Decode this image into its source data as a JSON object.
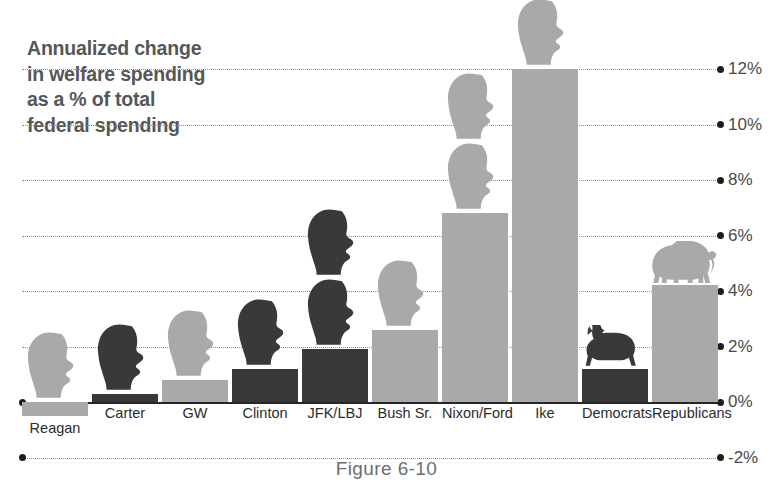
{
  "chart_data": {
    "type": "bar",
    "title": "Annualized change in welfare spending as a % of total federal spending",
    "title_lines": [
      "Annualized change",
      "in welfare spending",
      "as a % of total",
      "federal spending"
    ],
    "xlabel": "",
    "ylabel": "",
    "ylim": [
      -2,
      12.8
    ],
    "yticks": [
      12,
      10,
      8,
      6,
      4,
      2,
      0,
      -2
    ],
    "ytick_labels": [
      "12%",
      "10%",
      "8%",
      "6%",
      "4%",
      "2%",
      "0%",
      "-2%"
    ],
    "grid": true,
    "legend": "none",
    "categories": [
      "Reagan",
      "Carter",
      "GW",
      "Clinton",
      "JFK/LBJ",
      "Bush Sr.",
      "Nixon/Ford",
      "Ike",
      "Democrats",
      "Republicans"
    ],
    "values": [
      -0.5,
      0.3,
      0.8,
      1.2,
      1.9,
      2.6,
      6.8,
      12.0,
      1.2,
      4.2
    ],
    "party": [
      "republican",
      "democrat",
      "republican",
      "democrat",
      "democrat",
      "republican",
      "republican",
      "republican",
      "democrat",
      "republican"
    ],
    "icon_counts": [
      1,
      1,
      1,
      1,
      2,
      1,
      2,
      1,
      1,
      1
    ],
    "icons": [
      "head",
      "head",
      "head",
      "head",
      "head",
      "head",
      "head",
      "head",
      "donkey",
      "elephant"
    ]
  },
  "colors": {
    "republican_bar": "#a9a9a9",
    "democrat_bar": "#393939",
    "title_text": "#565656",
    "axis_text": "#4a4a4a",
    "grid": "#8d8d8d",
    "baseline": "#262626",
    "background": "#ffffff"
  },
  "ticks": [
    {
      "label": "12%",
      "value": 12
    },
    {
      "label": "10%",
      "value": 10
    },
    {
      "label": "8%",
      "value": 8
    },
    {
      "label": "6%",
      "value": 6
    },
    {
      "label": "4%",
      "value": 4
    },
    {
      "label": "2%",
      "value": 2
    },
    {
      "label": "0%",
      "value": 0
    },
    {
      "label": "-2%",
      "value": -2
    }
  ],
  "bars": [
    {
      "label": "Reagan",
      "value": -0.5,
      "party": "republican"
    },
    {
      "label": "Carter",
      "value": 0.3,
      "party": "democrat"
    },
    {
      "label": "GW",
      "value": 0.8,
      "party": "republican"
    },
    {
      "label": "Clinton",
      "value": 1.2,
      "party": "democrat"
    },
    {
      "label": "JFK/LBJ",
      "value": 1.9,
      "party": "democrat"
    },
    {
      "label": "Bush Sr.",
      "value": 2.6,
      "party": "republican"
    },
    {
      "label": "Nixon/Ford",
      "value": 6.8,
      "party": "republican"
    },
    {
      "label": "Ike",
      "value": 12.0,
      "party": "republican"
    },
    {
      "label": "Democrats",
      "value": 1.2,
      "party": "democrat"
    },
    {
      "label": "Republicans",
      "value": 4.2,
      "party": "republican"
    }
  ],
  "caption": "Figure 6-10"
}
